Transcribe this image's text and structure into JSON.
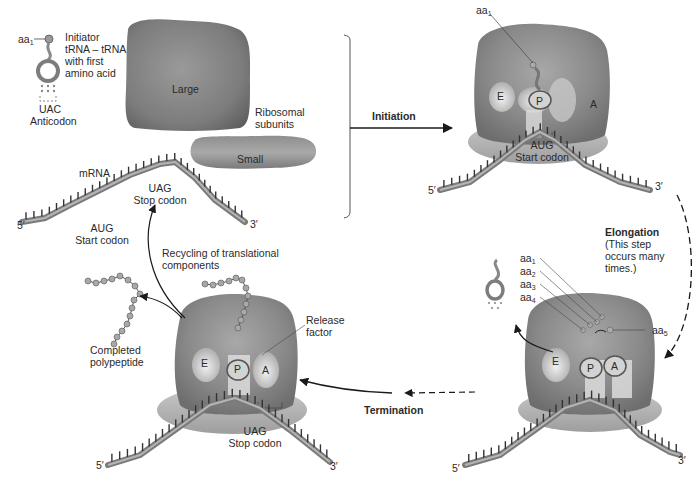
{
  "colors": {
    "ribosome_dark": "#7a7a7a",
    "ribosome_light": "#d9d9d9",
    "mrna_dark": "#6b6b6b",
    "mrna_light": "#c8c8c8",
    "arrow": "#1a1a1a",
    "text": "#2a2a2a"
  },
  "components_panel": {
    "trna_aa": "aa",
    "trna_aa_sub": "1",
    "trna_label_lines": [
      "Initiator",
      "tRNA – tRNA",
      "with first",
      "amino acid"
    ],
    "anticodon_seq": "UAC",
    "anticodon_label": "Anticodon",
    "large_subunit": "Large",
    "small_subunit": "Small",
    "ribosomal_subunits_lines": [
      "Ribosomal",
      "subunits"
    ],
    "mrna_label": "mRNA",
    "stop_codon_seq": "UAG",
    "stop_codon_label": "Stop codon",
    "start_codon_seq": "AUG",
    "start_codon_label": "Start codon",
    "five_prime": "5′",
    "three_prime": "3′"
  },
  "steps": {
    "initiation": "Initiation",
    "elongation": "Elongation",
    "elongation_note_lines": [
      "(This step",
      "occurs many",
      "times.)"
    ],
    "termination": "Termination",
    "recycling_lines": [
      "Recycling of translational",
      "components"
    ]
  },
  "initiation_complex": {
    "aa": "aa",
    "aa_sub": "1",
    "sites": [
      "E",
      "P",
      "A"
    ],
    "codon_seq": "AUG",
    "codon_label": "Start codon",
    "five_prime": "5′",
    "three_prime": "3′"
  },
  "elongation_complex": {
    "chain": [
      {
        "aa": "aa",
        "sub": "1"
      },
      {
        "aa": "aa",
        "sub": "2"
      },
      {
        "aa": "aa",
        "sub": "3"
      },
      {
        "aa": "aa",
        "sub": "4"
      }
    ],
    "incoming": {
      "aa": "aa",
      "sub": "5"
    },
    "sites": [
      "E",
      "P",
      "A"
    ],
    "five_prime": "5′",
    "three_prime": "3′"
  },
  "termination_complex": {
    "release_factor_lines": [
      "Release",
      "factor"
    ],
    "sites": [
      "E",
      "P",
      "A"
    ],
    "codon_seq": "UAG",
    "codon_label": "Stop codon",
    "polypeptide_lines": [
      "Completed",
      "polypeptide"
    ],
    "five_prime": "5′",
    "three_prime": "3′"
  }
}
